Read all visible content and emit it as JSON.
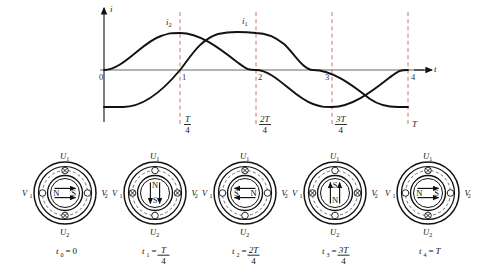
{
  "chart": {
    "type": "line",
    "y_axis_label": "i",
    "x_axis_label": "t",
    "curve_labels": {
      "i1": "i",
      "i1_sub": "1",
      "i2": "i",
      "i2_sub": "2"
    },
    "x_tick_labels": [
      "0",
      "1",
      "2",
      "3",
      "4"
    ],
    "period_labels": [
      {
        "num": "T",
        "den": "4",
        "whole": null
      },
      {
        "num": "2T",
        "den": "4",
        "whole": null
      },
      {
        "num": "3T",
        "den": "4",
        "whole": null
      },
      {
        "num": null,
        "den": null,
        "whole": "T"
      }
    ]
  },
  "chart_data": {
    "type": "line",
    "title": "",
    "xlabel": "t",
    "ylabel": "i",
    "xlim": [
      0,
      4.35
    ],
    "ylim": [
      -1.15,
      1.15
    ],
    "grid": false,
    "legend": "inline-annotations",
    "x_ticks": [
      0,
      1,
      2,
      3,
      4
    ],
    "x_tick_labels": [
      "0",
      "1",
      "2",
      "3",
      "4"
    ],
    "vertical_dashed_lines": [
      {
        "x": 1,
        "label": "T/4"
      },
      {
        "x": 2,
        "label": "2T/4"
      },
      {
        "x": 3,
        "label": "3T/4"
      },
      {
        "x": 4,
        "label": "T"
      }
    ],
    "series": [
      {
        "name": "i2",
        "formula": "sin(pi*x/2)",
        "amplitude": 1,
        "period": 4,
        "phase_deg": 0,
        "x": [
          0,
          0.5,
          1,
          1.5,
          2,
          2.5,
          3,
          3.5,
          4
        ],
        "values": [
          0,
          0.71,
          1,
          0.71,
          0,
          -0.71,
          -1,
          -0.71,
          0
        ]
      },
      {
        "name": "i1",
        "formula": "-cos(pi*x/2)",
        "amplitude": 1,
        "period": 4,
        "phase_deg": -90,
        "x": [
          0,
          0.5,
          1,
          1.5,
          2,
          2.5,
          3,
          3.5,
          4
        ],
        "values": [
          -1,
          -0.71,
          0,
          0.71,
          1,
          0.71,
          0,
          -0.71,
          -1
        ]
      }
    ]
  },
  "motors": [
    {
      "id": "motor-0",
      "top_terminal": "U",
      "top_sub": "1",
      "bottom_terminal": "U",
      "bottom_sub": "2",
      "left_terminal": "V",
      "left_sub": "1",
      "right_terminal": "V",
      "right_sub": "2",
      "pole_left": "N",
      "pole_right": "S",
      "pole_top": "",
      "pole_bottom": "",
      "orientation": "horizontal",
      "arrow_direction": "right",
      "top_symbol": "cross",
      "bottom_symbol": "cross",
      "left_symbol": "dot",
      "right_symbol": "dot",
      "time_var": "t",
      "time_sub": "0",
      "time_eq": "=",
      "time_whole": "0",
      "time_num": null,
      "time_den": null
    },
    {
      "id": "motor-1",
      "top_terminal": "U",
      "top_sub": "1",
      "bottom_terminal": "U",
      "bottom_sub": "2",
      "left_terminal": "V",
      "left_sub": "1",
      "right_terminal": "V",
      "right_sub": "2",
      "pole_left": "",
      "pole_right": "",
      "pole_top": "N",
      "pole_bottom": "S",
      "orientation": "vertical",
      "arrow_direction": "down",
      "top_symbol": "dot",
      "bottom_symbol": "dot",
      "left_symbol": "cross",
      "right_symbol": "cross",
      "time_var": "t",
      "time_sub": "1",
      "time_eq": "=",
      "time_whole": null,
      "time_num": "T",
      "time_den": "4"
    },
    {
      "id": "motor-2",
      "top_terminal": "U",
      "top_sub": "1",
      "bottom_terminal": "U",
      "bottom_sub": "2",
      "left_terminal": "V",
      "left_sub": "1",
      "right_terminal": "V",
      "right_sub": "2",
      "pole_left": "S",
      "pole_right": "N",
      "pole_top": "",
      "pole_bottom": "",
      "orientation": "horizontal",
      "arrow_direction": "left",
      "top_symbol": "cross",
      "bottom_symbol": "dot",
      "left_symbol": "dot",
      "right_symbol": "dot",
      "time_var": "t",
      "time_sub": "2",
      "time_eq": "=",
      "time_whole": null,
      "time_num": "2T",
      "time_den": "4"
    },
    {
      "id": "motor-3",
      "top_terminal": "U",
      "top_sub": "1",
      "bottom_terminal": "U",
      "bottom_sub": "2",
      "left_terminal": "V",
      "left_sub": "1",
      "right_terminal": "V",
      "right_sub": "2",
      "pole_left": "",
      "pole_right": "",
      "pole_top": "S",
      "pole_bottom": "N",
      "orientation": "vertical",
      "arrow_direction": "up",
      "top_symbol": "dot",
      "bottom_symbol": "dot",
      "left_symbol": "cross",
      "right_symbol": "cross",
      "time_var": "t",
      "time_sub": "3",
      "time_eq": "=",
      "time_whole": null,
      "time_num": "3T",
      "time_den": "4"
    },
    {
      "id": "motor-4",
      "top_terminal": "U",
      "top_sub": "1",
      "bottom_terminal": "U",
      "bottom_sub": "2",
      "left_terminal": "V",
      "left_sub": "1",
      "right_terminal": "V",
      "right_sub": "2",
      "pole_left": "N",
      "pole_right": "S",
      "pole_top": "",
      "pole_bottom": "",
      "orientation": "horizontal",
      "arrow_direction": "right",
      "top_symbol": "cross",
      "bottom_symbol": "cross",
      "left_symbol": "dot",
      "right_symbol": "dot",
      "time_var": "t",
      "time_sub": "4",
      "time_eq": "=",
      "time_whole": "T",
      "time_num": null,
      "time_den": null
    }
  ]
}
